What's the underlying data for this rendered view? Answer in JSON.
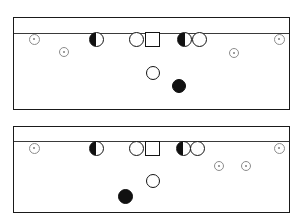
{
  "figure": {
    "title": "",
    "width": 303,
    "height": 224,
    "background_color": "#ffffff",
    "outline_color": "#1a1a1a",
    "rule_color": "#3a3a3a",
    "marker_fill_dark": "#111111",
    "marker_fill_light": "#ffffff",
    "small_marker_color": "#8c8c8c"
  },
  "panels": [
    {
      "id": "panel-top",
      "name": "top-panel",
      "x": 13,
      "y": 17,
      "width": 277,
      "height": 93,
      "header_rule_offset": 15,
      "markers": [
        {
          "name": "small-circle",
          "shape": "small-circle",
          "x": 33,
          "y": 38,
          "size": 11
        },
        {
          "name": "small-circle",
          "shape": "small-circle",
          "x": 63,
          "y": 51,
          "size": 10
        },
        {
          "name": "half-circle",
          "shape": "half-circle",
          "x": 95,
          "y": 38,
          "size": 15
        },
        {
          "name": "open-circle",
          "shape": "open-circle",
          "x": 135,
          "y": 38,
          "size": 15
        },
        {
          "name": "square",
          "shape": "square",
          "x": 151,
          "y": 38,
          "size": 15
        },
        {
          "name": "half-circle",
          "shape": "half-circle",
          "x": 183,
          "y": 38,
          "size": 15
        },
        {
          "name": "open-circle",
          "shape": "open-circle",
          "x": 198,
          "y": 38,
          "size": 15
        },
        {
          "name": "small-circle",
          "shape": "small-circle",
          "x": 233,
          "y": 52,
          "size": 10
        },
        {
          "name": "small-circle",
          "shape": "small-circle",
          "x": 278,
          "y": 38,
          "size": 11
        },
        {
          "name": "open-circle",
          "shape": "open-circle",
          "x": 152,
          "y": 72,
          "size": 14
        },
        {
          "name": "solid-circle",
          "shape": "solid-circle",
          "x": 178,
          "y": 85,
          "size": 14
        }
      ]
    },
    {
      "id": "panel-bottom",
      "name": "bottom-panel",
      "x": 13,
      "y": 126,
      "width": 277,
      "height": 87,
      "header_rule_offset": 14,
      "markers": [
        {
          "name": "small-circle",
          "shape": "small-circle",
          "x": 33,
          "y": 147,
          "size": 11
        },
        {
          "name": "half-circle",
          "shape": "half-circle",
          "x": 95,
          "y": 147,
          "size": 15
        },
        {
          "name": "open-circle",
          "shape": "open-circle",
          "x": 135,
          "y": 147,
          "size": 15
        },
        {
          "name": "square",
          "shape": "square",
          "x": 151,
          "y": 147,
          "size": 15
        },
        {
          "name": "half-circle",
          "shape": "half-circle",
          "x": 182,
          "y": 147,
          "size": 15
        },
        {
          "name": "open-circle",
          "shape": "open-circle",
          "x": 196,
          "y": 147,
          "size": 15
        },
        {
          "name": "small-circle",
          "shape": "small-circle",
          "x": 218,
          "y": 165,
          "size": 10
        },
        {
          "name": "small-circle",
          "shape": "small-circle",
          "x": 245,
          "y": 165,
          "size": 10
        },
        {
          "name": "small-circle",
          "shape": "small-circle",
          "x": 278,
          "y": 147,
          "size": 11
        },
        {
          "name": "open-circle",
          "shape": "open-circle",
          "x": 152,
          "y": 180,
          "size": 14
        },
        {
          "name": "solid-circle",
          "shape": "solid-circle",
          "x": 124,
          "y": 195,
          "size": 15
        }
      ]
    }
  ]
}
